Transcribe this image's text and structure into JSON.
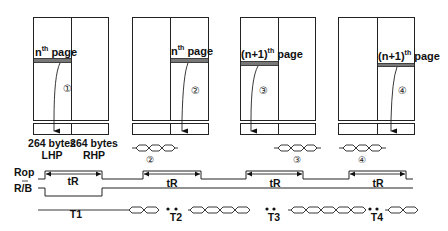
{
  "diagram": {
    "blocks": [
      {
        "id": 1,
        "page_label_base": "n",
        "page_label_sup": "th",
        "page_label_suffix": " page",
        "half": "left",
        "step": "①"
      },
      {
        "id": 2,
        "page_label_base": "n",
        "page_label_sup": "th",
        "page_label_suffix": " page",
        "half": "right",
        "step": "②"
      },
      {
        "id": 3,
        "page_label_base": "(n+1)",
        "page_label_sup": "th",
        "page_label_suffix": " page",
        "half": "left",
        "step": "③"
      },
      {
        "id": 4,
        "page_label_base": "(n+1)",
        "page_label_sup": "th",
        "page_label_suffix": " page",
        "half": "right",
        "step": "④"
      }
    ],
    "buffer_labels": {
      "left_size": "264 bytes",
      "left_name": "LHP",
      "right_size": "264 bytes",
      "right_name": "RHP"
    },
    "data_out_steps": [
      "②",
      "③",
      "④"
    ],
    "signals": {
      "rop": "Rop",
      "rb": "R/B",
      "tR": "tR"
    },
    "periods": [
      "T1",
      "T2",
      "T3",
      "T4"
    ]
  }
}
